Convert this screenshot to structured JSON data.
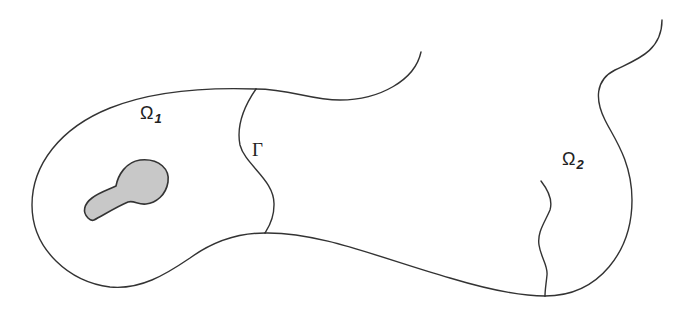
{
  "figure": {
    "colors": {
      "stroke": "#333333",
      "hole_fill": "#c8c8c8",
      "background": "#ffffff"
    }
  },
  "labels": {
    "omega1": {
      "symbol": "Ω",
      "subscript": "1"
    },
    "omega2": {
      "symbol": "Ω",
      "subscript": "2"
    },
    "interface": {
      "symbol": "Γ"
    }
  }
}
